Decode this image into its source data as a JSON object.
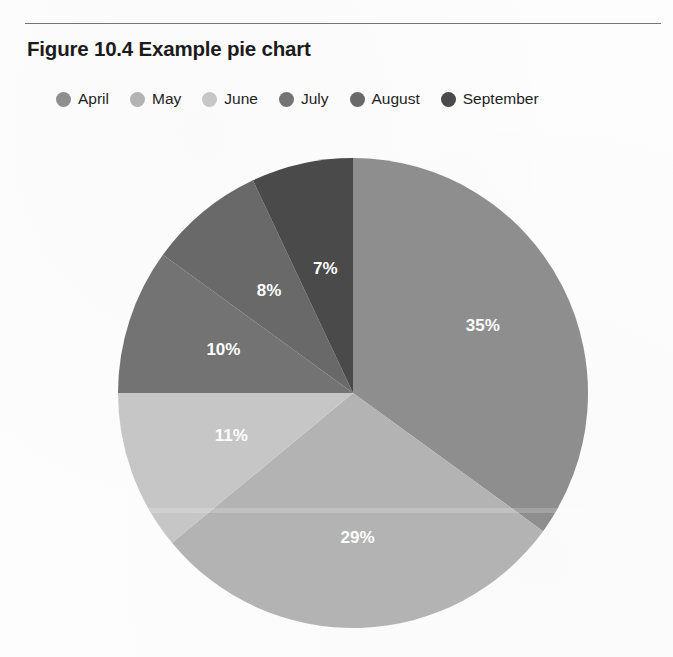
{
  "figure": {
    "title": "Figure 10.4 Example pie chart",
    "rule_color": "#5d5d5d"
  },
  "legend": {
    "position": "top",
    "items": [
      {
        "label": "April",
        "color": "#8e8e8e"
      },
      {
        "label": "May",
        "color": "#b3b3b3"
      },
      {
        "label": "June",
        "color": "#c6c6c6"
      },
      {
        "label": "July",
        "color": "#737373"
      },
      {
        "label": "August",
        "color": "#696969"
      },
      {
        "label": "September",
        "color": "#4a4a4a"
      }
    ]
  },
  "chart_data": {
    "type": "pie",
    "title": "Figure 10.4 Example pie chart",
    "xlabel": "",
    "ylabel": "",
    "legend_position": "top",
    "grid": false,
    "start_angle_deg": 0,
    "direction": "clockwise",
    "categories": [
      "April",
      "May",
      "June",
      "July",
      "August",
      "September"
    ],
    "values": [
      35,
      29,
      11,
      10,
      8,
      7
    ],
    "labels": [
      "35%",
      "29%",
      "11%",
      "10%",
      "8%",
      "7%"
    ],
    "colors": [
      "#8e8e8e",
      "#b3b3b3",
      "#c6c6c6",
      "#737373",
      "#696969",
      "#4a4a4a"
    ],
    "label_color": "#ffffff",
    "units": "percent",
    "total": 100
  }
}
